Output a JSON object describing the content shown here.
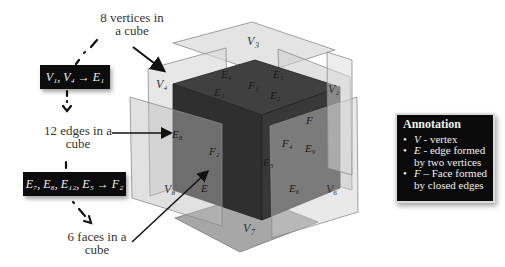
{
  "captions": {
    "vertices": "8 vertices in a cube",
    "vertices_line1": "8 vertices in",
    "vertices_line2": "a cube",
    "edges_line1": "12 edges in a",
    "edges_line2": "cube",
    "faces_line1": "6 faces in a",
    "faces_line2": "cube"
  },
  "formulas": {
    "vertex_to_edge": "V₁, V₄ → E₁",
    "edges_to_face": "E₇, E₈, E₁₂, E₅ → F₂"
  },
  "annotation": {
    "title": "Annotation",
    "items": [
      {
        "symbol": "V",
        "text": " - vertex"
      },
      {
        "symbol": "E",
        "text": " - edge formed by two vertices"
      },
      {
        "symbol": "F",
        "text": " – Face formed by closed edges"
      }
    ]
  },
  "cube_labels": {
    "vertices": [
      "V₁",
      "V₂",
      "V₃",
      "V₄",
      "V₅",
      "V₆",
      "V₇",
      "V₈"
    ],
    "v1": "V₁",
    "v2": "V₂",
    "v4": "V₄",
    "v5": "V₅",
    "v6": "V₆",
    "v8": "V₈",
    "e1": "E₁",
    "e2": "E₂",
    "e3": "E₃",
    "e4": "E₄",
    "e5": "E₅",
    "e6": "E₆",
    "e7": "E₇",
    "e8": "E₈",
    "e9": "E₉",
    "e12": "E₁₂",
    "f1": "F₁",
    "f2": "F₂",
    "f3": "F₃",
    "f4": "F₄"
  },
  "colors": {
    "cube_top": "#3c3c3c",
    "cube_left": "#2f2f2f",
    "cube_right": "#353535",
    "plane": "#c8c8c8",
    "box_bg": "#0a0a0a"
  }
}
